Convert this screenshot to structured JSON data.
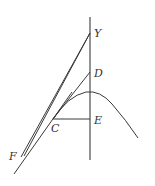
{
  "figure": {
    "labels": {
      "Y": "Y",
      "D": "D",
      "E": "E",
      "C": "C",
      "F": "F"
    },
    "points": {
      "Y": [
        90,
        33
      ],
      "D": [
        90,
        72
      ],
      "E": [
        90,
        119
      ],
      "C": [
        53,
        119
      ],
      "F": [
        22,
        156
      ],
      "curve_peak": [
        90,
        92
      ],
      "curve_end": [
        138,
        138
      ]
    },
    "colors": {
      "line": "#3a3a3a",
      "axis": "#5a5a5a",
      "label": "#333333",
      "background": "#ffffff"
    }
  }
}
